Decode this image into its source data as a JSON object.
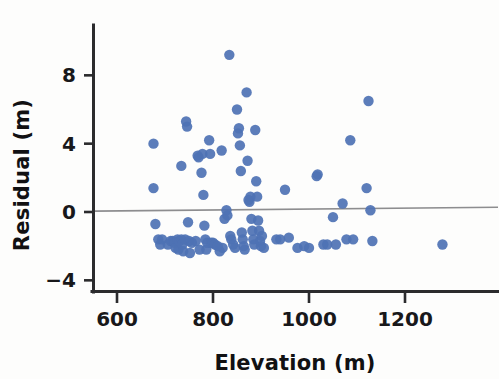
{
  "figure": {
    "background_color": "#fdfdfc",
    "width": 499,
    "height": 379
  },
  "axes": {
    "x_title": "Elevation (m)",
    "y_title": "Residual (m)",
    "x_ticks": [
      "600",
      "800",
      "1000",
      "1200"
    ],
    "y_ticks": [
      "8",
      "4",
      "0",
      "−4"
    ],
    "spine_color": "#2b2b2d",
    "tick_text_color": "#18181a"
  },
  "reference_line": {
    "color": "#8d8d8f",
    "y_at_left": 0.05,
    "y_at_right": 0.28
  },
  "marker": {
    "color": "#4e72b4",
    "radius_px": 5.2,
    "shape": "circle"
  },
  "chart_data": {
    "type": "scatter",
    "title": "",
    "xlabel": "Elevation (m)",
    "ylabel": "Residual (m)",
    "xlim": [
      540,
      1320
    ],
    "ylim": [
      -5.2,
      10.6
    ],
    "xticks": [
      600,
      800,
      1000,
      1200
    ],
    "yticks": [
      -4,
      0,
      4,
      8
    ],
    "grid": false,
    "legend": null,
    "series": [
      {
        "name": "Residuals",
        "color": "#4e72b4",
        "points": [
          [
            676,
            4.0
          ],
          [
            676,
            1.4
          ],
          [
            680,
            -0.7
          ],
          [
            686,
            -1.6
          ],
          [
            690,
            -1.9
          ],
          [
            694,
            -1.6
          ],
          [
            706,
            -1.9
          ],
          [
            712,
            -1.7
          ],
          [
            716,
            -1.7
          ],
          [
            720,
            -1.8
          ],
          [
            722,
            -2.1
          ],
          [
            726,
            -1.6
          ],
          [
            728,
            -2.2
          ],
          [
            730,
            -1.7
          ],
          [
            734,
            2.7
          ],
          [
            734,
            -1.6
          ],
          [
            736,
            -1.9
          ],
          [
            738,
            -2.3
          ],
          [
            742,
            -1.6
          ],
          [
            744,
            5.3
          ],
          [
            746,
            5.0
          ],
          [
            748,
            -0.6
          ],
          [
            750,
            -1.7
          ],
          [
            752,
            -2.4
          ],
          [
            756,
            -1.8
          ],
          [
            764,
            -1.7
          ],
          [
            768,
            3.3
          ],
          [
            770,
            3.2
          ],
          [
            772,
            -2.2
          ],
          [
            776,
            2.3
          ],
          [
            778,
            3.4
          ],
          [
            780,
            1.0
          ],
          [
            782,
            -0.8
          ],
          [
            784,
            -1.6
          ],
          [
            786,
            -2.2
          ],
          [
            788,
            -1.8
          ],
          [
            792,
            4.2
          ],
          [
            794,
            3.4
          ],
          [
            796,
            -1.8
          ],
          [
            800,
            -1.8
          ],
          [
            804,
            -1.9
          ],
          [
            810,
            -2.0
          ],
          [
            814,
            -2.3
          ],
          [
            818,
            3.6
          ],
          [
            820,
            -2.1
          ],
          [
            824,
            -0.4
          ],
          [
            828,
            0.1
          ],
          [
            830,
            -0.2
          ],
          [
            834,
            9.2
          ],
          [
            836,
            -1.4
          ],
          [
            838,
            -1.6
          ],
          [
            842,
            -1.9
          ],
          [
            846,
            -2.1
          ],
          [
            850,
            6.0
          ],
          [
            852,
            4.6
          ],
          [
            854,
            4.9
          ],
          [
            856,
            3.9
          ],
          [
            858,
            2.4
          ],
          [
            860,
            -1.2
          ],
          [
            862,
            -1.6
          ],
          [
            864,
            -2.0
          ],
          [
            866,
            -2.2
          ],
          [
            870,
            7.0
          ],
          [
            872,
            3.0
          ],
          [
            874,
            0.7
          ],
          [
            876,
            0.6
          ],
          [
            878,
            0.9
          ],
          [
            880,
            -0.4
          ],
          [
            882,
            -1.1
          ],
          [
            884,
            -1.6
          ],
          [
            886,
            -1.9
          ],
          [
            888,
            4.8
          ],
          [
            890,
            1.8
          ],
          [
            892,
            0.9
          ],
          [
            894,
            -0.5
          ],
          [
            896,
            -1.1
          ],
          [
            898,
            -1.7
          ],
          [
            900,
            -2.0
          ],
          [
            902,
            -1.4
          ],
          [
            906,
            -2.1
          ],
          [
            932,
            -1.6
          ],
          [
            940,
            -1.6
          ],
          [
            950,
            1.3
          ],
          [
            958,
            -1.5
          ],
          [
            976,
            -2.1
          ],
          [
            990,
            -2.0
          ],
          [
            1000,
            -2.1
          ],
          [
            1016,
            2.1
          ],
          [
            1018,
            2.2
          ],
          [
            1030,
            -1.9
          ],
          [
            1038,
            -1.9
          ],
          [
            1050,
            -0.3
          ],
          [
            1056,
            -1.9
          ],
          [
            1070,
            0.5
          ],
          [
            1078,
            -1.6
          ],
          [
            1086,
            4.2
          ],
          [
            1092,
            -1.6
          ],
          [
            1120,
            1.4
          ],
          [
            1124,
            6.5
          ],
          [
            1128,
            0.1
          ],
          [
            1132,
            -1.7
          ],
          [
            1278,
            -1.9
          ]
        ]
      }
    ]
  }
}
